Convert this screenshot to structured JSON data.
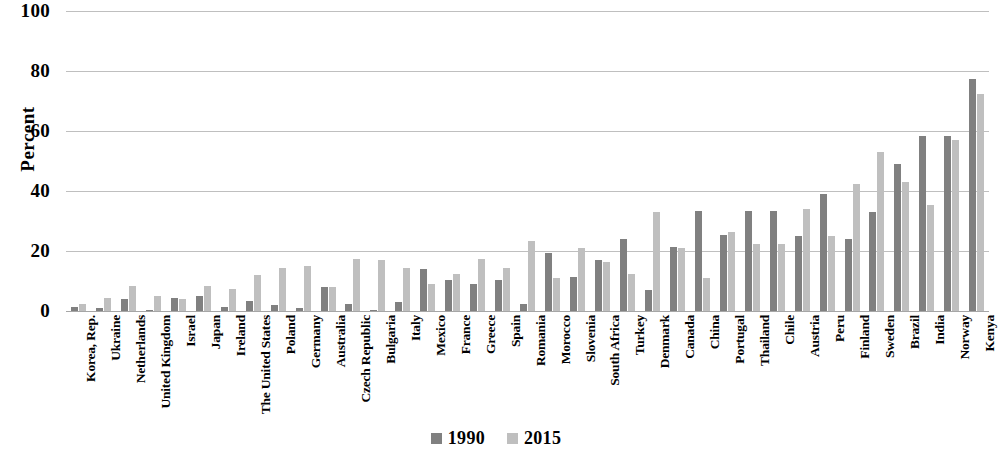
{
  "chart_data": {
    "type": "bar",
    "title": "",
    "subtitle": "",
    "xlabel": "",
    "ylabel": "Percent",
    "ylim": [
      0,
      100
    ],
    "yticks": [
      0,
      20,
      40,
      60,
      80,
      100
    ],
    "grid": true,
    "legend_position": "bottom",
    "orientation": "vertical",
    "bar_rotation_xlabels": -90,
    "colors": {
      "series_1990": "#808080",
      "series_2015": "#bfbfbf",
      "gridline": "#bfbfbf",
      "text": "#000000",
      "background": "#ffffff"
    },
    "categories": [
      "Korea, Rep.",
      "Ukraine",
      "Netherlands",
      "United Kingdom",
      "Israel",
      "Japan",
      "Ireland",
      "The United States",
      "Poland",
      "Germany",
      "Australia",
      "Czech Republic",
      "Bulgaria",
      "Italy",
      "Mexico",
      "France",
      "Greece",
      "Spain",
      "Romania",
      "Morocco",
      "Slovenia",
      "South Africa",
      "Turkey",
      "Denmark",
      "Canada",
      "China",
      "Portugal",
      "Thailand",
      "Chile",
      "Austria",
      "Peru",
      "Finland",
      "Sweden",
      "Brazil",
      "India",
      "Norway",
      "Kenya"
    ],
    "series": [
      {
        "name": "1990",
        "color": "#808080",
        "values": [
          1.5,
          1.0,
          4.0,
          0.5,
          4.5,
          5.0,
          1.5,
          3.5,
          2.0,
          1.0,
          8.0,
          2.5,
          0.5,
          3.0,
          14.0,
          10.5,
          9.0,
          10.5,
          2.5,
          19.5,
          11.5,
          17.0,
          24.0,
          7.0,
          21.5,
          33.5,
          25.5,
          33.5,
          33.5,
          25.0,
          39.0,
          24.0,
          33.0,
          49.0,
          58.5,
          58.5,
          77.5
        ]
      },
      {
        "name": "2015",
        "color": "#bfbfbf",
        "values": [
          2.5,
          4.5,
          8.5,
          5.0,
          4.0,
          8.5,
          7.5,
          12.0,
          14.5,
          15.0,
          8.0,
          17.5,
          17.0,
          14.5,
          9.0,
          12.5,
          17.5,
          14.5,
          23.5,
          11.0,
          21.0,
          16.5,
          12.5,
          33.0,
          21.0,
          11.0,
          26.5,
          22.5,
          22.5,
          34.0,
          25.0,
          42.5,
          53.0,
          43.0,
          35.5,
          57.0,
          72.5
        ]
      }
    ]
  },
  "axis": {
    "y_title": "Percent",
    "y_tick_labels": [
      "100",
      "80",
      "60",
      "40",
      "20",
      "0"
    ]
  },
  "legend": {
    "items": [
      {
        "label": "1990",
        "color": "#808080"
      },
      {
        "label": "2015",
        "color": "#bfbfbf"
      }
    ]
  }
}
